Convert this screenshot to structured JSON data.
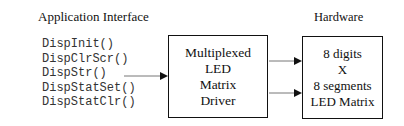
{
  "left_title": "Application Interface",
  "right_title": "Hardware",
  "api_functions": [
    "DispInit()",
    "DispClrScr()",
    "DispStr()",
    "DispStatSet()",
    "DispStatClr()"
  ],
  "driver_box": {
    "lines": [
      "Multiplexed",
      "LED",
      "Matrix",
      "Driver"
    ]
  },
  "hardware_box": {
    "lines": [
      "8 digits",
      "X",
      "8 segments",
      "LED Matrix"
    ]
  }
}
